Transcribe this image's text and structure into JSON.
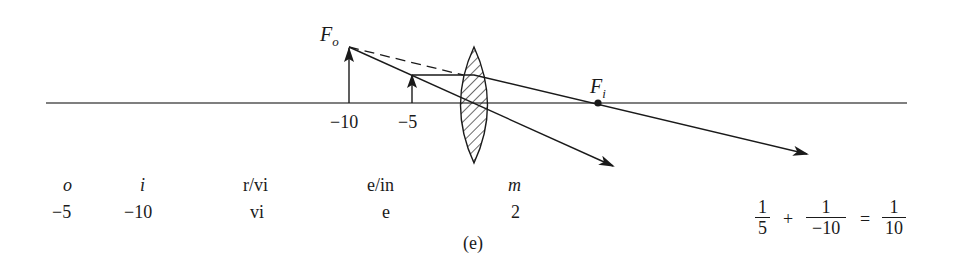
{
  "figure": {
    "caption": "(e)",
    "axis_ticks": [
      {
        "label": "−10",
        "x": 349
      },
      {
        "label": "−5",
        "x": 412
      }
    ],
    "focal_points": {
      "object_side": {
        "label": "F",
        "subscript": "o"
      },
      "image_side": {
        "label": "F",
        "subscript": "i"
      }
    },
    "colors": {
      "ink": "#1a1a1a",
      "background": "#ffffff"
    }
  },
  "table": {
    "headers": {
      "o": "o",
      "i": "i",
      "rvi": "r/vi",
      "ein": "e/in",
      "m": "m"
    },
    "values": {
      "o": "−5",
      "i": "−10",
      "rvi": "vi",
      "ein": "e",
      "m": "2"
    }
  },
  "equation": {
    "term1": {
      "num": "1",
      "den": "5"
    },
    "plus": "+",
    "term2": {
      "num": "1",
      "den": "−10"
    },
    "equals": "=",
    "term3": {
      "num": "1",
      "den": "10"
    }
  }
}
